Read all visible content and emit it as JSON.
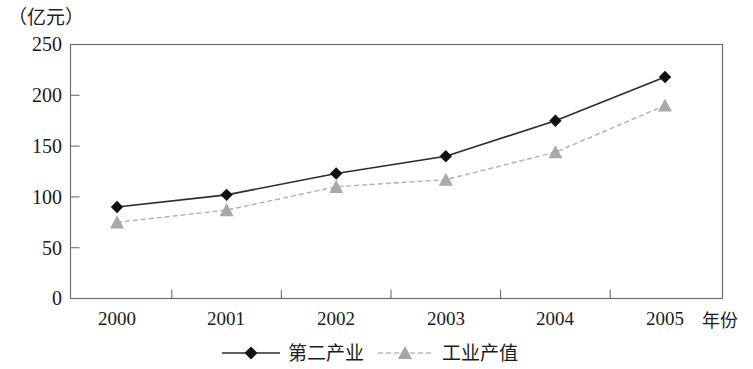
{
  "chart_data": {
    "type": "line",
    "title": "",
    "subtitle": "",
    "unit_label": "（亿元）",
    "xlabel": "年份",
    "ylabel": "",
    "categories": [
      "2000",
      "2001",
      "2002",
      "2003",
      "2004",
      "2005"
    ],
    "x": [
      2000,
      2001,
      2002,
      2003,
      2004,
      2005
    ],
    "series": [
      {
        "name": "第二产业",
        "values": [
          90,
          102,
          123,
          140,
          175,
          218
        ],
        "color": "#1a1a1a",
        "marker": "diamond",
        "linestyle": "solid"
      },
      {
        "name": "工业产值",
        "values": [
          75,
          87,
          110,
          117,
          144,
          190
        ],
        "color": "#a8a8a8",
        "marker": "triangle",
        "linestyle": "dashed"
      }
    ],
    "ylim": [
      0,
      250
    ],
    "yticks": [
      0,
      50,
      100,
      150,
      200,
      250
    ],
    "ytick_labels": [
      "0",
      "50",
      "100",
      "150",
      "200",
      "250"
    ],
    "xtick_labels": [
      "2000",
      "2001",
      "2002",
      "2003",
      "2004",
      "2005"
    ],
    "grid": false,
    "legend_position": "bottom",
    "legend_entries": [
      "第二产业",
      "工业产值"
    ]
  },
  "axis": {
    "unit": "（亿元）",
    "x_axis_name": "年份",
    "y_ticks": [
      "250",
      "200",
      "150",
      "100",
      "50",
      "0"
    ]
  },
  "legend": {
    "items": [
      {
        "label": "第二产业"
      },
      {
        "label": "工业产值"
      }
    ]
  }
}
